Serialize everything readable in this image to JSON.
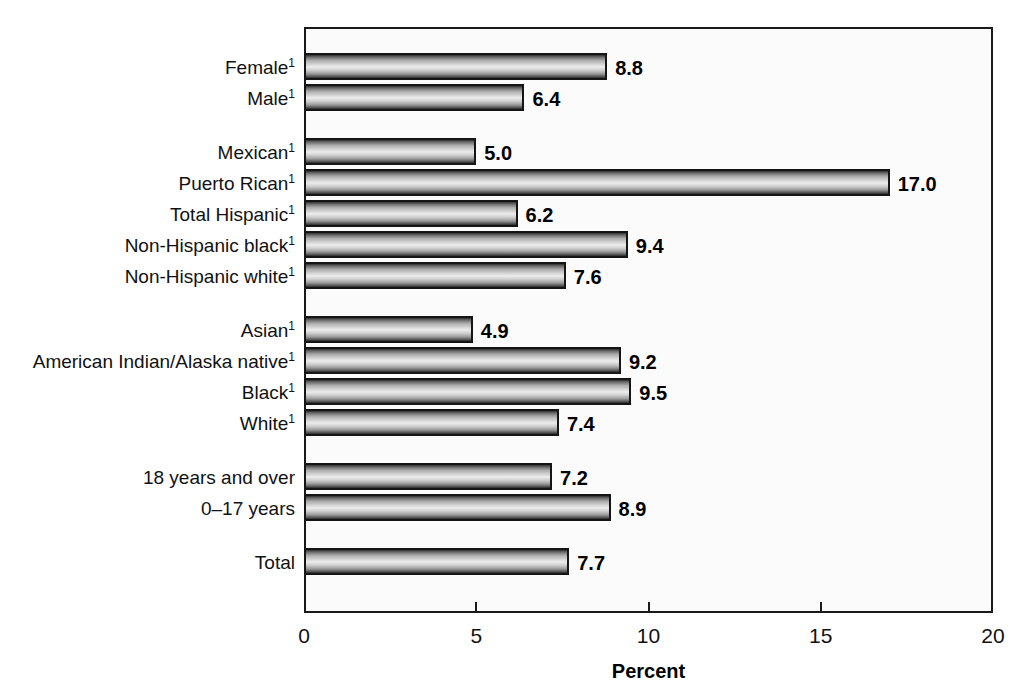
{
  "chart_data": {
    "type": "bar",
    "orientation": "horizontal",
    "title": "",
    "subtitle": "",
    "xlabel": "Percent",
    "ylabel": "",
    "xlim": [
      0,
      20
    ],
    "xticks": [
      0,
      5,
      10,
      15,
      20
    ],
    "xtick_labels": [
      "0",
      "5",
      "10",
      "15",
      "20"
    ],
    "grid": false,
    "legend": null,
    "footnote_marker": "1",
    "categories": [
      "Female1",
      "Male1",
      "Mexican1",
      "Puerto Rican1",
      "Total Hispanic1",
      "Non-Hispanic black1",
      "Non-Hispanic white1",
      "Asian1",
      "American Indian/Alaska native1",
      "Black1",
      "White1",
      "18 years and over",
      "0–17 years",
      "Total"
    ],
    "values": [
      8.8,
      6.4,
      5.0,
      17.0,
      6.2,
      9.4,
      7.6,
      4.9,
      9.2,
      9.5,
      7.4,
      7.2,
      8.9,
      7.7
    ],
    "bars": [
      {
        "label": "Female",
        "sup": "1",
        "value": 8.8,
        "value_label": "8.8",
        "group": 0
      },
      {
        "label": "Male",
        "sup": "1",
        "value": 6.4,
        "value_label": "6.4",
        "group": 0
      },
      {
        "label": "Mexican",
        "sup": "1",
        "value": 5.0,
        "value_label": "5.0",
        "group": 1
      },
      {
        "label": "Puerto Rican",
        "sup": "1",
        "value": 17.0,
        "value_label": "17.0",
        "group": 1
      },
      {
        "label": "Total Hispanic",
        "sup": "1",
        "value": 6.2,
        "value_label": "6.2",
        "group": 1
      },
      {
        "label": "Non-Hispanic black",
        "sup": "1",
        "value": 9.4,
        "value_label": "9.4",
        "group": 1
      },
      {
        "label": "Non-Hispanic white",
        "sup": "1",
        "value": 7.6,
        "value_label": "7.6",
        "group": 1
      },
      {
        "label": "Asian",
        "sup": "1",
        "value": 4.9,
        "value_label": "4.9",
        "group": 2
      },
      {
        "label": "American Indian/Alaska native",
        "sup": "1",
        "value": 9.2,
        "value_label": "9.2",
        "group": 2
      },
      {
        "label": "Black",
        "sup": "1",
        "value": 9.5,
        "value_label": "9.5",
        "group": 2
      },
      {
        "label": "White",
        "sup": "1",
        "value": 7.4,
        "value_label": "7.4",
        "group": 2
      },
      {
        "label": "18 years and over",
        "sup": "",
        "value": 7.2,
        "value_label": "7.2",
        "group": 3
      },
      {
        "label": "0–17 years",
        "sup": "",
        "value": 8.9,
        "value_label": "8.9",
        "group": 3
      },
      {
        "label": "Total",
        "sup": "",
        "value": 7.7,
        "value_label": "7.7",
        "group": 4
      }
    ],
    "colors": {
      "bar_outline": "#151515",
      "bar_fill_light": "#ececec",
      "bar_fill_dark": "#2b2b2b",
      "frame": "#1a1a1a",
      "plot_background": "#fbfbfb",
      "text": "#000000"
    }
  }
}
